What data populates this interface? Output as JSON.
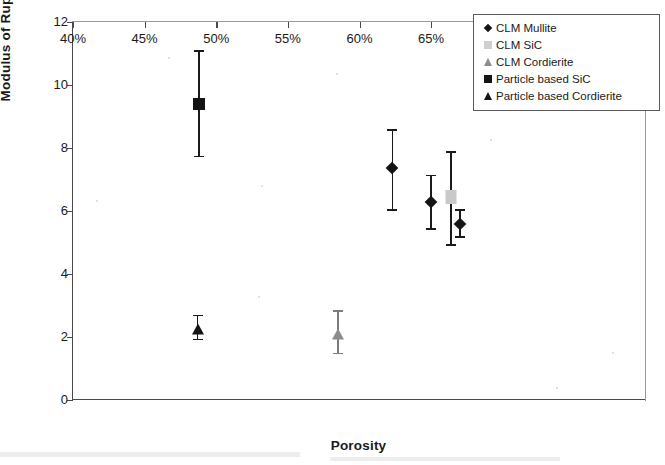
{
  "chart_data": {
    "type": "scatter",
    "title": "",
    "xlabel": "Porosity",
    "ylabel": "Modulus of Rupture (MPa)",
    "xlim": [
      40,
      80
    ],
    "ylim": [
      0,
      12
    ],
    "xticks": [
      "40%",
      "45%",
      "50%",
      "55%",
      "60%",
      "65%",
      "70%",
      "75%",
      "80%"
    ],
    "xtick_values": [
      40,
      45,
      50,
      55,
      60,
      65,
      70,
      75,
      80
    ],
    "yticks": [
      "0",
      "2",
      "4",
      "6",
      "8",
      "10",
      "12"
    ],
    "ytick_values": [
      0,
      2,
      4,
      6,
      8,
      10,
      12
    ],
    "grid": false,
    "legend_position": "top-right",
    "errorbars": true,
    "series": [
      {
        "name": "CLM Mullite",
        "marker": "diamond",
        "color": "#141414",
        "points": [
          {
            "x": 62.3,
            "y": 7.35,
            "y_low": 6.05,
            "y_high": 8.6
          },
          {
            "x": 65.0,
            "y": 6.3,
            "y_low": 5.45,
            "y_high": 7.15
          },
          {
            "x": 67.0,
            "y": 5.6,
            "y_low": 5.2,
            "y_high": 6.05
          }
        ]
      },
      {
        "name": "CLM SiC",
        "marker": "square",
        "color": "#c9c9c9",
        "points": [
          {
            "x": 66.4,
            "y": 6.45,
            "y_low": 4.95,
            "y_high": 7.9
          }
        ]
      },
      {
        "name": "CLM Cordierite",
        "marker": "triangle",
        "color": "#8c8c8c",
        "points": [
          {
            "x": 58.5,
            "y": 2.1,
            "y_low": 1.5,
            "y_high": 2.85
          }
        ]
      },
      {
        "name": "Particle based SiC",
        "marker": "square",
        "color": "#141414",
        "points": [
          {
            "x": 48.8,
            "y": 9.4,
            "y_low": 7.75,
            "y_high": 11.1
          }
        ]
      },
      {
        "name": "Particle based Cordierite",
        "marker": "triangle",
        "color": "#141414",
        "points": [
          {
            "x": 48.7,
            "y": 2.25,
            "y_low": 1.95,
            "y_high": 2.7
          }
        ]
      }
    ]
  },
  "legend": {
    "items": [
      {
        "label": "CLM Mullite",
        "swatch": "diamond-dark"
      },
      {
        "label": "CLM SiC",
        "swatch": "square-light"
      },
      {
        "label": "CLM Cordierite",
        "swatch": "triangle-gray"
      },
      {
        "label": "Particle based SiC",
        "swatch": "square-dark"
      },
      {
        "label": "Particle based Cordierite",
        "swatch": "triangle-dark"
      }
    ]
  }
}
